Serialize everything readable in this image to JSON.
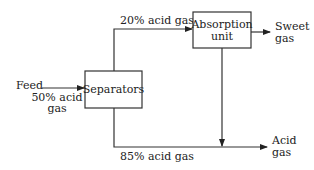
{
  "diagram": {
    "type": "process-flow",
    "nodes": {
      "separators": {
        "label": "Separators"
      },
      "absorption": {
        "label_line1": "Absorption",
        "label_line2": "unit"
      }
    },
    "labels": {
      "feed": "Feed",
      "feed_comp_line1": "50% acid",
      "feed_comp_line2": "gas",
      "top_stream": "20% acid gas",
      "bottom_stream": "85% acid gas",
      "sweet_line1": "Sweet",
      "sweet_line2": "gas",
      "acid_line1": "Acid",
      "acid_line2": "gas"
    },
    "edges": [
      {
        "from": "feed",
        "to": "separators",
        "label": "50% acid gas"
      },
      {
        "from": "separators",
        "to": "absorption",
        "label": "20% acid gas"
      },
      {
        "from": "absorption",
        "to": "sweet_gas",
        "label": ""
      },
      {
        "from": "absorption",
        "to": "acid_gas_line",
        "label": ""
      },
      {
        "from": "separators",
        "to": "acid_gas",
        "label": "85% acid gas"
      }
    ],
    "colors": {
      "line": "#333333",
      "text": "#222222",
      "background": "#ffffff"
    }
  }
}
